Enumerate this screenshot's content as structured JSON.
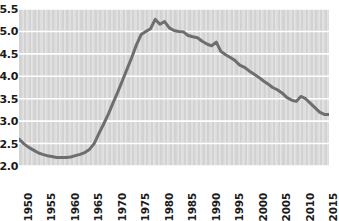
{
  "chart_data": {
    "type": "line",
    "title": "",
    "subtitle": "",
    "xlabel": "",
    "ylabel": "",
    "xlim": [
      1950,
      2016
    ],
    "ylim": [
      2.0,
      5.5
    ],
    "grid": true,
    "legend": null,
    "line_color": "#6e6e6e",
    "band_color_a": "#d2d2d2",
    "band_color_b": "#dedede",
    "gridline_color": "#ffffff",
    "y_ticks": [
      "2.0",
      "2.5",
      "3.0",
      "3.5",
      "4.0",
      "4.5",
      "5.0",
      "5.5"
    ],
    "y_tick_values": [
      2.0,
      2.5,
      3.0,
      3.5,
      4.0,
      4.5,
      5.0,
      5.5
    ],
    "x_ticks": [
      "1950",
      "1955",
      "1960",
      "1965",
      "1970",
      "1975",
      "1980",
      "1985",
      "1990",
      "1995",
      "2000",
      "2005",
      "2010",
      "2015"
    ],
    "x_tick_values": [
      1950,
      1955,
      1960,
      1965,
      1970,
      1975,
      1980,
      1985,
      1990,
      1995,
      2000,
      2005,
      2010,
      2015
    ],
    "x": [
      1950,
      1951,
      1952,
      1953,
      1954,
      1955,
      1956,
      1957,
      1958,
      1959,
      1960,
      1961,
      1962,
      1963,
      1964,
      1965,
      1966,
      1967,
      1968,
      1969,
      1970,
      1971,
      1972,
      1973,
      1974,
      1975,
      1976,
      1977,
      1978,
      1979,
      1980,
      1981,
      1982,
      1983,
      1984,
      1985,
      1986,
      1987,
      1988,
      1989,
      1990,
      1991,
      1992,
      1993,
      1994,
      1995,
      1996,
      1997,
      1998,
      1999,
      2000,
      2001,
      2002,
      2003,
      2004,
      2005,
      2006,
      2007,
      2008,
      2009,
      2010,
      2011,
      2012,
      2013,
      2014,
      2015,
      2016
    ],
    "values": [
      2.6,
      2.5,
      2.42,
      2.36,
      2.3,
      2.26,
      2.23,
      2.21,
      2.19,
      2.19,
      2.19,
      2.2,
      2.23,
      2.26,
      2.3,
      2.37,
      2.5,
      2.72,
      2.93,
      3.15,
      3.4,
      3.64,
      3.9,
      4.16,
      4.42,
      4.7,
      4.93,
      5.0,
      5.06,
      5.27,
      5.16,
      5.22,
      5.08,
      5.02,
      5.0,
      4.99,
      4.91,
      4.88,
      4.86,
      4.78,
      4.72,
      4.68,
      4.76,
      4.55,
      4.48,
      4.42,
      4.35,
      4.25,
      4.2,
      4.12,
      4.05,
      3.98,
      3.9,
      3.83,
      3.75,
      3.7,
      3.63,
      3.53,
      3.47,
      3.44,
      3.55,
      3.5,
      3.4,
      3.3,
      3.2,
      3.15,
      3.15
    ]
  }
}
